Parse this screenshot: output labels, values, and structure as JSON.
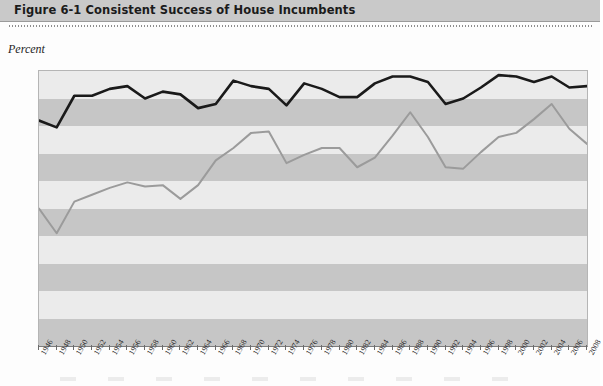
{
  "header": {
    "figure_number": "Figure 6-1",
    "title": "Figure 6-1  Consistent Success of House Incumbents"
  },
  "axis": {
    "ylabel": "Percent",
    "yticks": [
      0,
      10,
      20,
      30,
      40,
      50,
      60,
      70,
      80,
      90,
      100
    ],
    "ylim": [
      0,
      100
    ],
    "xticks": [
      1946,
      1948,
      1950,
      1952,
      1954,
      1956,
      1958,
      1960,
      1962,
      1964,
      1966,
      1968,
      1970,
      1972,
      1974,
      1976,
      1978,
      1980,
      1982,
      1984,
      1986,
      1988,
      1990,
      1992,
      1994,
      1996,
      1998,
      2000,
      2002,
      2004,
      2006,
      2008
    ]
  },
  "colors": {
    "header_bar": "#c9c9c9",
    "band_dark": "#c6c6c6",
    "band_light": "#ebebeb",
    "series_dark": "#1a1a1a",
    "series_grey": "#9b9b9b",
    "axis": "#6f6f6f"
  },
  "chart_data": {
    "type": "line",
    "title": "Consistent Success of House Incumbents",
    "xlabel": "",
    "ylabel": "Percent",
    "ylim": [
      0,
      100
    ],
    "xlim": [
      1946,
      2008
    ],
    "grid": "horizontal-bands",
    "legend": "none",
    "categories": [
      1946,
      1948,
      1950,
      1952,
      1954,
      1956,
      1958,
      1960,
      1962,
      1964,
      1966,
      1968,
      1970,
      1972,
      1974,
      1976,
      1978,
      1980,
      1982,
      1984,
      1986,
      1988,
      1990,
      1992,
      1994,
      1996,
      1998,
      2000,
      2002,
      2004,
      2006,
      2008
    ],
    "series": [
      {
        "name": "Incumbents reelected",
        "color": "#1a1a1a",
        "values": [
          82,
          79.5,
          91,
          91,
          93.5,
          94.5,
          90,
          92.5,
          91.5,
          86.5,
          88,
          96.5,
          94.5,
          93.5,
          87.5,
          95.5,
          93.5,
          90.5,
          90.5,
          95.5,
          98,
          98,
          96,
          88,
          90,
          94,
          98.5,
          98,
          96,
          98,
          94,
          94.5
        ]
      },
      {
        "name": "Incumbents winning with 60 percent or more of the vote",
        "color": "#9b9b9b",
        "values": [
          50,
          41,
          52.5,
          55,
          57.5,
          59.5,
          58,
          58.5,
          53.5,
          58.5,
          67.5,
          72,
          77.5,
          78,
          66.5,
          69.5,
          72,
          72,
          65,
          68.5,
          76.5,
          85,
          76,
          65,
          64.5,
          70.5,
          76,
          77.5,
          82.5,
          88,
          79,
          73.5
        ]
      }
    ]
  }
}
